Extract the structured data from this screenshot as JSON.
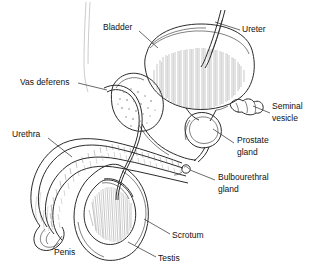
{
  "figure": {
    "style": "black-and-white pen-and-ink line drawing with hatched shading",
    "background_color": "#ffffff",
    "ink_color": "#2b2b2b",
    "width": 317,
    "height": 278
  },
  "labels": [
    {
      "id": "bladder",
      "text": "Bladder",
      "lines": [
        "Bladder"
      ],
      "x": 103,
      "y": 28,
      "anchor": "start",
      "leader_from": [
        139,
        31
      ],
      "leader_to": [
        158,
        48
      ]
    },
    {
      "id": "ureter",
      "text": "Ureter",
      "lines": [
        "Ureter"
      ],
      "x": 242,
      "y": 30,
      "anchor": "start",
      "leader_from": [
        240,
        30
      ],
      "leader_to": [
        215,
        22
      ]
    },
    {
      "id": "vas-deferens",
      "text": "Vas deferens",
      "lines": [
        "Vas deferens"
      ],
      "x": 20,
      "y": 83,
      "anchor": "start",
      "leader_from": [
        78,
        83
      ],
      "leader_to": [
        107,
        90
      ]
    },
    {
      "id": "seminal-vesicle",
      "text": "Seminal vesicle",
      "lines": [
        "Seminal",
        "vesicle"
      ],
      "x": 272,
      "y": 111,
      "anchor": "start",
      "leader_from": [
        270,
        113
      ],
      "leader_to": [
        253,
        106
      ]
    },
    {
      "id": "urethra",
      "text": "Urethra",
      "lines": [
        "Urethra"
      ],
      "x": 12,
      "y": 135,
      "anchor": "start",
      "leader_from": [
        48,
        138
      ],
      "leader_to": [
        72,
        157
      ]
    },
    {
      "id": "prostate-gland",
      "text": "Prostate gland",
      "lines": [
        "Prostate",
        "gland"
      ],
      "x": 237,
      "y": 145,
      "anchor": "start",
      "leader_from": [
        234,
        143
      ],
      "leader_to": [
        213,
        129
      ]
    },
    {
      "id": "bulbourethral-gland",
      "text": "Bulbourethral gland",
      "lines": [
        "Bulbourethral",
        "gland"
      ],
      "x": 218,
      "y": 182,
      "anchor": "start",
      "leader_from": [
        215,
        180
      ],
      "leader_to": [
        190,
        170
      ]
    },
    {
      "id": "scrotum",
      "text": "Scrotum",
      "lines": [
        "Scrotum"
      ],
      "x": 172,
      "y": 236,
      "anchor": "start",
      "leader_from": [
        170,
        234
      ],
      "leader_to": [
        144,
        219
      ]
    },
    {
      "id": "testis",
      "text": "Testis",
      "lines": [
        "Testis"
      ],
      "x": 158,
      "y": 259,
      "anchor": "start",
      "leader_from": [
        156,
        257
      ],
      "leader_to": [
        128,
        242
      ]
    },
    {
      "id": "penis",
      "text": "Penis",
      "lines": [
        "Penis"
      ],
      "x": 54,
      "y": 253,
      "anchor": "start",
      "leader_from": [
        52,
        250
      ],
      "leader_to": [
        62,
        236
      ]
    }
  ],
  "structures": [
    {
      "id": "bladder",
      "name": "Bladder",
      "note": "large rounded sac, upper centre-right, dense vertical hatching"
    },
    {
      "id": "ureter",
      "name": "Ureter",
      "note": "narrow tube entering bladder from upper right"
    },
    {
      "id": "vas-deferens",
      "name": "Vas deferens",
      "note": "long slender duct looping from upper left down around bladder to prostate"
    },
    {
      "id": "seminal-vesicle",
      "name": "Seminal vesicle",
      "note": "small lobed pouch behind bladder on the right"
    },
    {
      "id": "prostate-gland",
      "name": "Prostate gland",
      "note": "ring-shaped gland below bladder encircling urethra"
    },
    {
      "id": "bulbourethral-gland",
      "name": "Bulbourethral gland",
      "note": "tiny round gland beneath prostate on the urethra"
    },
    {
      "id": "urethra",
      "name": "Urethra",
      "note": "hatched channel running the length of the penis"
    },
    {
      "id": "penis",
      "name": "Penis",
      "note": "shaft curving down-left with glans at lower left"
    },
    {
      "id": "scrotum",
      "name": "Scrotum",
      "note": "sac outline enclosing the testis"
    },
    {
      "id": "testis",
      "name": "Testis",
      "note": "oval organ with radial hatching inside the scrotum"
    }
  ]
}
